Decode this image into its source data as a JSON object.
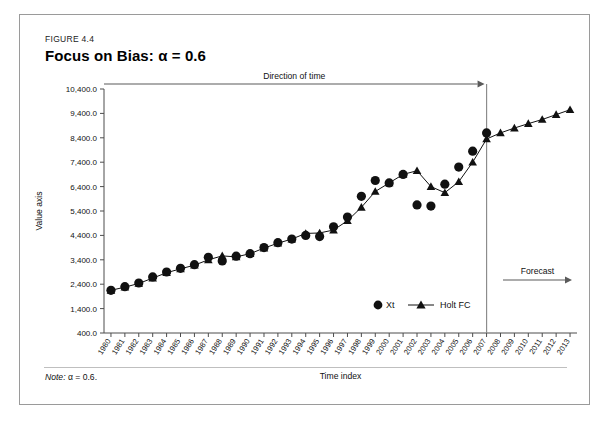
{
  "figure": {
    "label": "FIGURE 4.4",
    "title": "Focus on Bias: α = 0.6",
    "note_prefix": "Note:",
    "note_text": " α = 0.6."
  },
  "annotations": {
    "direction_of_time": "Direction of time",
    "forecast": "Forecast"
  },
  "legend": {
    "xt": "Xt",
    "holt": "Holt FC"
  },
  "colors": {
    "ink": "#111111",
    "axis": "#4d4d4d",
    "frame": "#9a9a9a",
    "divider": "#8c8c8c",
    "arrow": "#5a5a5a"
  },
  "chart_data": {
    "type": "line",
    "title": "Focus on Bias: α = 0.6",
    "xlabel": "Time index",
    "ylabel": "Value axis",
    "ylim": [
      400.0,
      10400.0
    ],
    "ytick_step": 1000.0,
    "grid": false,
    "legend_position": "inside-bottom-right",
    "ytick_labels": [
      "400.0",
      "1,400.0",
      "2,400.0",
      "3,400.0",
      "4,400.0",
      "5,400.0",
      "6,400.0",
      "7,400.0",
      "8,400.0",
      "9,400.0",
      "10,400.0"
    ],
    "ytick_values": [
      400,
      1400,
      2400,
      3400,
      4400,
      5400,
      6400,
      7400,
      8400,
      9400,
      10400
    ],
    "categories": [
      "1980",
      "1981",
      "1982",
      "1983",
      "1984",
      "1985",
      "1986",
      "1987",
      "1988",
      "1989",
      "1990",
      "1991",
      "1992",
      "1993",
      "1994",
      "1995",
      "1996",
      "1997",
      "1998",
      "1999",
      "2000",
      "2001",
      "2002",
      "2003",
      "2004",
      "2005",
      "2006",
      "2007",
      "2008",
      "2009",
      "2010",
      "2011",
      "2012",
      "2013"
    ],
    "forecast_start": "2008",
    "divider_at": "2007",
    "series": [
      {
        "name": "Xt",
        "marker": "circle",
        "line": false,
        "x": [
          "1980",
          "1981",
          "1982",
          "1983",
          "1984",
          "1985",
          "1986",
          "1987",
          "1988",
          "1989",
          "1990",
          "1991",
          "1992",
          "1993",
          "1994",
          "1995",
          "1996",
          "1997",
          "1998",
          "1999",
          "2000",
          "2001",
          "2002",
          "2003",
          "2004",
          "2005",
          "2006",
          "2007"
        ],
        "values": [
          2150,
          2300,
          2450,
          2700,
          2900,
          3050,
          3200,
          3500,
          3350,
          3550,
          3650,
          3900,
          4100,
          4250,
          4400,
          4350,
          4750,
          5150,
          6000,
          6650,
          6550,
          6900,
          5650,
          5600,
          6500,
          7200,
          7850,
          8600
        ]
      },
      {
        "name": "Holt FC",
        "marker": "triangle",
        "line": true,
        "x": [
          "1980",
          "1981",
          "1982",
          "1983",
          "1984",
          "1985",
          "1986",
          "1987",
          "1988",
          "1989",
          "1990",
          "1991",
          "1992",
          "1993",
          "1994",
          "1995",
          "1996",
          "1997",
          "1998",
          "1999",
          "2000",
          "2001",
          "2002",
          "2003",
          "2004",
          "2005",
          "2006",
          "2007",
          "2008",
          "2009",
          "2010",
          "2011",
          "2012",
          "2013"
        ],
        "values": [
          2150,
          2280,
          2430,
          2650,
          2870,
          3030,
          3180,
          3400,
          3560,
          3520,
          3650,
          3880,
          4080,
          4250,
          4480,
          4500,
          4620,
          5000,
          5550,
          6200,
          6550,
          6900,
          7050,
          6400,
          6150,
          6600,
          7400,
          8350,
          8600,
          8800,
          8980,
          9150,
          9350,
          9550
        ]
      }
    ]
  }
}
